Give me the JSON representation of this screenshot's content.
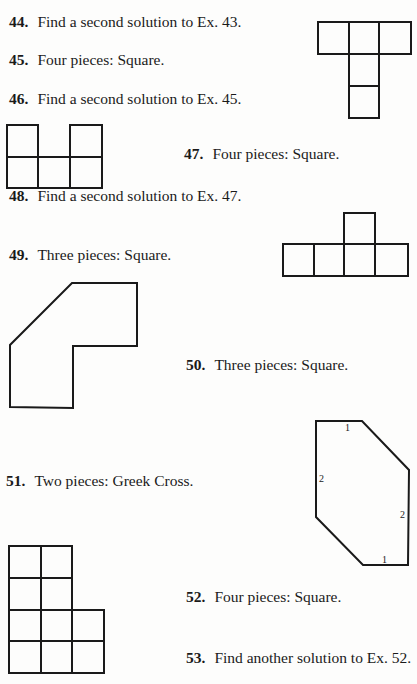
{
  "exercises": [
    {
      "number": "44.",
      "text": "Find a second solution to Ex. 43."
    },
    {
      "number": "45.",
      "text": "Four pieces: Square."
    },
    {
      "number": "46.",
      "text": "Find a second solution to Ex. 45."
    },
    {
      "number": "47.",
      "text": "Four pieces: Square."
    },
    {
      "number": "48.",
      "text": "Find a second solution to Ex. 47."
    },
    {
      "number": "49.",
      "text": "Three pieces: Square."
    },
    {
      "number": "50.",
      "text": "Three pieces: Square."
    },
    {
      "number": "51.",
      "text": "Two pieces: Greek Cross."
    },
    {
      "number": "52.",
      "text": "Four pieces: Square."
    },
    {
      "number": "53.",
      "text": "Find another solution to Ex. 52."
    }
  ],
  "figures": {
    "fig_51_labels": [
      "1",
      "2",
      "2",
      "1"
    ]
  }
}
